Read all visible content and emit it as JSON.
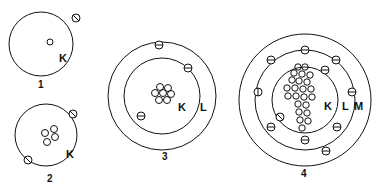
{
  "diagram": {
    "type": "bohr-atomic-models",
    "atoms": [
      {
        "number": "1",
        "shells": [
          "K"
        ],
        "electrons_per_shell": [
          1
        ],
        "nucleus_particles": 1
      },
      {
        "number": "2",
        "shells": [
          "K"
        ],
        "electrons_per_shell": [
          2
        ],
        "nucleus_particles": 4
      },
      {
        "number": "3",
        "shells": [
          "K",
          "L"
        ],
        "electrons_per_shell": [
          2,
          1
        ],
        "nucleus_particles": 7
      },
      {
        "number": "4",
        "shells": [
          "K",
          "L",
          "M"
        ],
        "electrons_per_shell": [
          2,
          8,
          1
        ],
        "nucleus_particles": 23
      }
    ],
    "labels": {
      "a1_num": "1",
      "a1_k": "K",
      "a2_num": "2",
      "a2_k": "K",
      "a3_num": "3",
      "a3_k": "K",
      "a3_l": "L",
      "a4_num": "4",
      "a4_k": "K",
      "a4_l": "L",
      "a4_m": "M"
    }
  }
}
